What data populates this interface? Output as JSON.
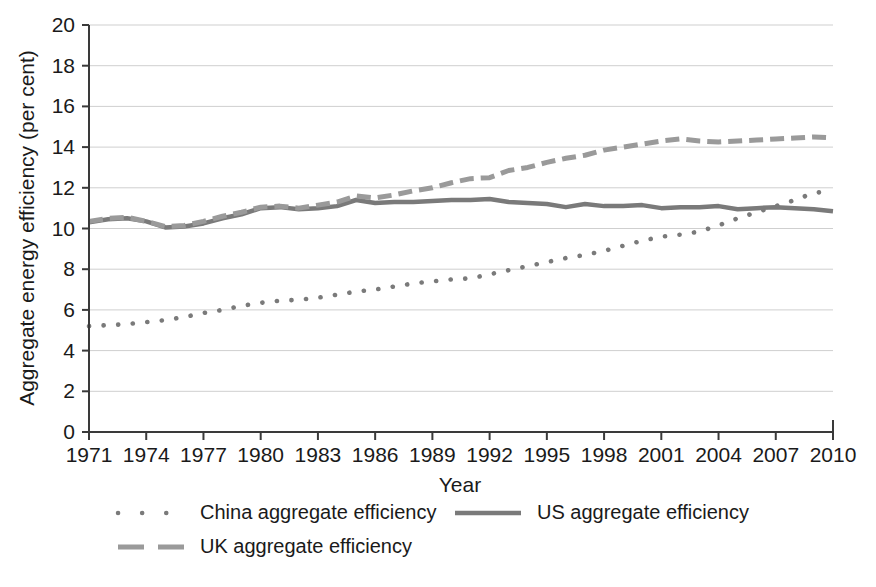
{
  "chart_data": {
    "type": "line",
    "title": "",
    "xlabel": "Year",
    "ylabel": "Aggregate energy efficiency (per cent)",
    "xlim": [
      1971,
      2010
    ],
    "ylim": [
      0,
      20
    ],
    "ytick_step": 2,
    "xtick_step": 3,
    "grid": "horizontal",
    "legend_position": "bottom",
    "yticks": [
      "0",
      "2",
      "4",
      "6",
      "8",
      "10",
      "12",
      "14",
      "16",
      "18",
      "20"
    ],
    "xticks": [
      "1971",
      "1974",
      "1977",
      "1980",
      "1983",
      "1986",
      "1989",
      "1992",
      "1995",
      "1998",
      "2001",
      "2004",
      "2007",
      "2010"
    ],
    "x": [
      1971,
      1972,
      1973,
      1974,
      1975,
      1976,
      1977,
      1978,
      1979,
      1980,
      1981,
      1982,
      1983,
      1984,
      1985,
      1986,
      1987,
      1988,
      1989,
      1990,
      1991,
      1992,
      1993,
      1994,
      1995,
      1996,
      1997,
      1998,
      1999,
      2000,
      2001,
      2002,
      2003,
      2004,
      2005,
      2006,
      2007,
      2008,
      2009,
      2010
    ],
    "series": [
      {
        "name": "China aggregate efficiency",
        "style": "dotted",
        "color": "#7a7a7a",
        "values": [
          5.2,
          5.25,
          5.3,
          5.4,
          5.5,
          5.65,
          5.85,
          6.0,
          6.2,
          6.35,
          6.45,
          6.5,
          6.6,
          6.75,
          6.9,
          7.0,
          7.15,
          7.3,
          7.4,
          7.5,
          7.55,
          7.75,
          7.95,
          8.15,
          8.35,
          8.55,
          8.7,
          8.9,
          9.15,
          9.4,
          9.6,
          9.7,
          9.85,
          10.15,
          10.5,
          10.8,
          11.1,
          11.4,
          11.75,
          11.85
        ]
      },
      {
        "name": "US aggregate efficiency",
        "style": "solid",
        "color": "#7a7a7a",
        "values": [
          10.3,
          10.45,
          10.5,
          10.35,
          10.05,
          10.1,
          10.25,
          10.5,
          10.7,
          11.0,
          11.05,
          10.95,
          11.0,
          11.1,
          11.4,
          11.25,
          11.3,
          11.3,
          11.35,
          11.4,
          11.4,
          11.45,
          11.3,
          11.25,
          11.2,
          11.05,
          11.2,
          11.1,
          11.1,
          11.15,
          11.0,
          11.05,
          11.05,
          11.1,
          10.95,
          11.0,
          11.05,
          11.0,
          10.95,
          10.85
        ]
      },
      {
        "name": "UK aggregate efficiency",
        "style": "dashed",
        "color": "#9a9a9a",
        "values": [
          10.35,
          10.5,
          10.55,
          10.35,
          10.1,
          10.15,
          10.35,
          10.6,
          10.8,
          11.05,
          11.1,
          11.0,
          11.15,
          11.3,
          11.6,
          11.5,
          11.65,
          11.85,
          12.0,
          12.25,
          12.45,
          12.5,
          12.85,
          13.0,
          13.25,
          13.45,
          13.6,
          13.85,
          14.0,
          14.15,
          14.3,
          14.4,
          14.3,
          14.25,
          14.3,
          14.35,
          14.4,
          14.45,
          14.5,
          14.45
        ]
      }
    ]
  },
  "legend": {
    "items": [
      {
        "label": "China aggregate efficiency",
        "style": "dotted"
      },
      {
        "label": "US aggregate efficiency",
        "style": "solid"
      },
      {
        "label": "UK aggregate efficiency",
        "style": "dashed"
      }
    ]
  },
  "colors": {
    "china": "#7a7a7a",
    "us": "#7a7a7a",
    "uk": "#9a9a9a",
    "axis": "#3a3a3a",
    "grid": "#cfcfcf",
    "text": "#1a1a1a",
    "background": "#ffffff"
  }
}
